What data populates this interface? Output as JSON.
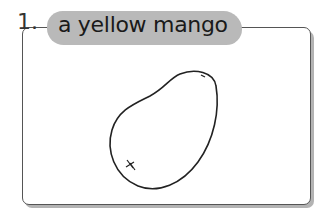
{
  "exercise": {
    "number": "1.",
    "label": "a yellow mango",
    "illustration": "mango-outline-drawing"
  },
  "colors": {
    "label_highlight": "#b9b9b9",
    "frame_border": "#555555",
    "frame_shadow": "#b3b3b3"
  }
}
